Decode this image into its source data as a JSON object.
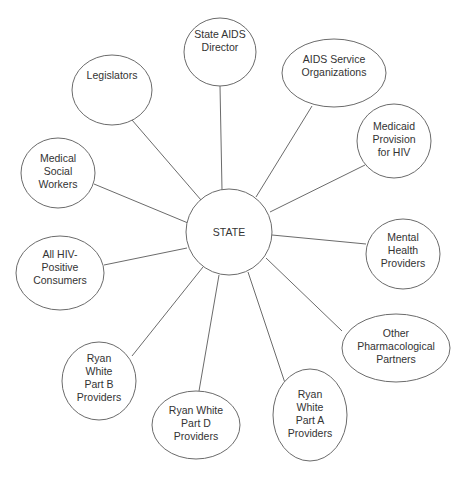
{
  "diagram": {
    "type": "hub-and-spoke",
    "center": {
      "id": "state",
      "label": [
        "STATE"
      ],
      "cx": 229,
      "cy": 232,
      "rx": 43,
      "ry": 43
    },
    "nodes": [
      {
        "id": "state-aids-director",
        "label": [
          "State AIDS",
          "Director"
        ],
        "cx": 220,
        "cy": 52,
        "rx": 36,
        "ry": 34,
        "label_offset": -12
      },
      {
        "id": "aids-service-organizations",
        "label": [
          "AIDS Service",
          "Organizations"
        ],
        "cx": 334,
        "cy": 73,
        "rx": 52,
        "ry": 34,
        "label_offset": -8
      },
      {
        "id": "medicaid-provision-for-hiv",
        "label": [
          "Medicaid",
          "Provision",
          "for  HIV"
        ],
        "cx": 394,
        "cy": 141,
        "rx": 37,
        "ry": 37,
        "label_offset": -2
      },
      {
        "id": "mental-health-providers",
        "label": [
          "Mental",
          "Health",
          "Providers"
        ],
        "cx": 403,
        "cy": 254,
        "rx": 37,
        "ry": 35,
        "label_offset": -4
      },
      {
        "id": "other-pharmacological-partners",
        "label": [
          "Other",
          "Pharmacological",
          "Partners"
        ],
        "cx": 396,
        "cy": 348,
        "rx": 54,
        "ry": 34,
        "label_offset": -2
      },
      {
        "id": "ryan-white-part-a-providers",
        "label": [
          "Ryan",
          "White",
          "Part A",
          "Providers"
        ],
        "cx": 310,
        "cy": 415,
        "rx": 37,
        "ry": 46,
        "label_offset": -2
      },
      {
        "id": "ryan-white-part-d-providers",
        "label": [
          "Ryan White",
          "Part D",
          "Providers"
        ],
        "cx": 196,
        "cy": 425,
        "rx": 44,
        "ry": 34,
        "label_offset": -2
      },
      {
        "id": "ryan-white-part-b-providers",
        "label": [
          "Ryan",
          "White",
          "Part B",
          "Providers"
        ],
        "cx": 99,
        "cy": 381,
        "rx": 37,
        "ry": 39,
        "label_offset": -4
      },
      {
        "id": "all-hiv-positive-consumers",
        "label": [
          "All HIV-",
          "Positive",
          "Consumers"
        ],
        "cx": 60,
        "cy": 273,
        "rx": 44,
        "ry": 37,
        "label_offset": -6
      },
      {
        "id": "medical-social-workers",
        "label": [
          "Medical",
          "Social",
          "Workers"
        ],
        "cx": 58,
        "cy": 173,
        "rx": 37,
        "ry": 35,
        "label_offset": -2
      },
      {
        "id": "legislators",
        "label": [
          "Legislators"
        ],
        "cx": 112,
        "cy": 90,
        "rx": 40,
        "ry": 35,
        "label_offset": -15
      }
    ],
    "edges": [
      {
        "to": "state-aids-director",
        "x1": 222,
        "y1": 190,
        "x2": 220,
        "y2": 86
      },
      {
        "to": "aids-service-organizations",
        "x1": 256,
        "y1": 197,
        "x2": 312,
        "y2": 106
      },
      {
        "to": "medicaid-provision-for-hiv",
        "x1": 270,
        "y1": 212,
        "x2": 365,
        "y2": 165
      },
      {
        "to": "mental-health-providers",
        "x1": 272,
        "y1": 235,
        "x2": 366,
        "y2": 244
      },
      {
        "to": "other-pharmacological-partners",
        "x1": 266,
        "y1": 258,
        "x2": 342,
        "y2": 331
      },
      {
        "to": "ryan-white-part-a-providers",
        "x1": 248,
        "y1": 272,
        "x2": 285,
        "y2": 383
      },
      {
        "to": "ryan-white-part-d-providers",
        "x1": 219,
        "y1": 275,
        "x2": 199,
        "y2": 391
      },
      {
        "to": "ryan-white-part-b-providers",
        "x1": 203,
        "y1": 267,
        "x2": 132,
        "y2": 356
      },
      {
        "to": "all-hiv-positive-consumers",
        "x1": 187,
        "y1": 248,
        "x2": 104,
        "y2": 265
      },
      {
        "to": "medical-social-workers",
        "x1": 188,
        "y1": 223,
        "x2": 94,
        "y2": 184
      },
      {
        "to": "legislators",
        "x1": 201,
        "y1": 200,
        "x2": 132,
        "y2": 120
      }
    ]
  }
}
